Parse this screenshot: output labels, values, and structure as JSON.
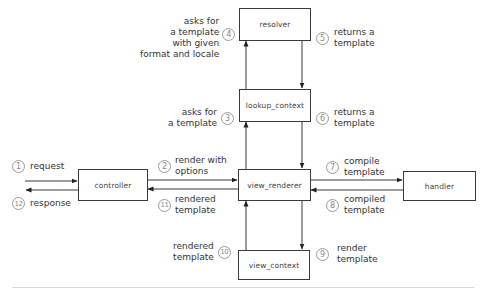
{
  "diagram": {
    "nodes": [
      {
        "id": "resolver",
        "label": "resolver"
      },
      {
        "id": "lookup_context",
        "label": "lookup_context"
      },
      {
        "id": "view_renderer",
        "label": "view_renderer"
      },
      {
        "id": "view_context",
        "label": "view_context"
      },
      {
        "id": "controller",
        "label": "controller"
      },
      {
        "id": "handler",
        "label": "handler"
      }
    ],
    "steps": [
      {
        "num": "1",
        "label": "request",
        "from": "outside",
        "to": "controller"
      },
      {
        "num": "2",
        "label": "render with\noptions",
        "from": "controller",
        "to": "view_renderer"
      },
      {
        "num": "3",
        "label": "asks for\na template",
        "from": "view_renderer",
        "to": "lookup_context"
      },
      {
        "num": "4",
        "label": "asks for\na template\nwith given\nformat and locale",
        "from": "lookup_context",
        "to": "resolver"
      },
      {
        "num": "5",
        "label": "returns a\ntemplate",
        "from": "resolver",
        "to": "lookup_context"
      },
      {
        "num": "6",
        "label": "returns a\ntemplate",
        "from": "lookup_context",
        "to": "view_renderer"
      },
      {
        "num": "7",
        "label": "compile\ntemplate",
        "from": "view_renderer",
        "to": "handler"
      },
      {
        "num": "8",
        "label": "compiled\ntemplate",
        "from": "handler",
        "to": "view_renderer"
      },
      {
        "num": "9",
        "label": "render\ntemplate",
        "from": "view_renderer",
        "to": "view_context"
      },
      {
        "num": "10",
        "label": "rendered\ntemplate",
        "from": "view_context",
        "to": "view_renderer"
      },
      {
        "num": "11",
        "label": "rendered\ntemplate",
        "from": "view_renderer",
        "to": "controller"
      },
      {
        "num": "12",
        "label": "response",
        "from": "controller",
        "to": "outside"
      }
    ],
    "colors": {
      "line": "#3a3a3a",
      "circle": "#9a9a9a",
      "rule": "#d8d8d8"
    }
  }
}
